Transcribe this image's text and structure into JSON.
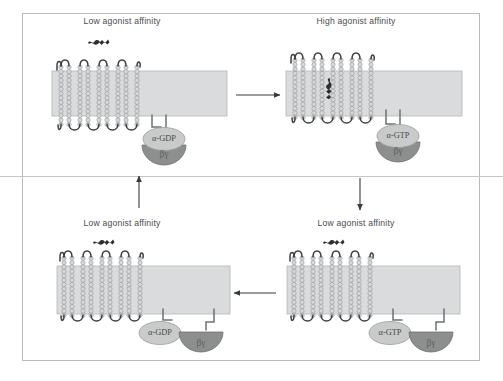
{
  "figure": {
    "type": "cycle-diagram",
    "colors": {
      "frame_border": "#b9bcbe",
      "membrane_fill": "#d9dbdc",
      "membrane_border": "#b5b8ba",
      "helix_bead": "#d5d7d8",
      "helix_outline": "#8f9294",
      "loop_stroke": "#3f3f3f",
      "alpha_fill": "#c9cbca",
      "alpha_border": "#9a9d9d",
      "betagamma_fill": "#8d8f8f",
      "betagamma_border": "#6e7070",
      "arrow": "#3a3a3a",
      "text": "#4b4b4b",
      "label_dark": "#4a4a4a"
    },
    "layout": {
      "grid": "2x2",
      "divider": "horizontal-line",
      "cycle_direction": "clockwise: top-left -> top-right -> bottom-right -> bottom-left -> top-left"
    }
  },
  "panels": [
    {
      "id": "top-left",
      "position": "top-left",
      "label": "Low agonist affinity",
      "agonist_state": "free",
      "agonist_location": "unbound, above receptor",
      "nucleotide": "GDP",
      "alpha_label": "α-GDP",
      "betagamma_label": "βγ",
      "g_protein_state": "heterotrimer-associated",
      "receptor_helices": 7
    },
    {
      "id": "top-right",
      "position": "top-right",
      "label": "High agonist affinity",
      "agonist_state": "bound",
      "agonist_location": "bound within receptor helices",
      "nucleotide": "GTP",
      "alpha_label": "α-GTP",
      "betagamma_label": "βγ",
      "g_protein_state": "heterotrimer-associated",
      "receptor_helices": 7
    },
    {
      "id": "bottom-right",
      "position": "bottom-right",
      "label": "Low agonist affinity",
      "agonist_state": "free",
      "agonist_location": "unbound, above receptor",
      "nucleotide": "GTP",
      "alpha_label": "α-GTP",
      "betagamma_label": "βγ",
      "g_protein_state": "dissociated",
      "receptor_helices": 7
    },
    {
      "id": "bottom-left",
      "position": "bottom-left",
      "label": "Low agonist affinity",
      "agonist_state": "free",
      "agonist_location": "unbound, above receptor",
      "nucleotide": "GDP",
      "alpha_label": "α-GDP",
      "betagamma_label": "βγ",
      "g_protein_state": "dissociated",
      "receptor_helices": 7
    }
  ],
  "arrows": [
    {
      "id": "top",
      "direction": "right",
      "from": "top-left",
      "to": "top-right"
    },
    {
      "id": "right",
      "direction": "down",
      "from": "top-right",
      "to": "bottom-right"
    },
    {
      "id": "bottom",
      "direction": "left",
      "from": "bottom-right",
      "to": "bottom-left"
    },
    {
      "id": "left",
      "direction": "up",
      "from": "bottom-left",
      "to": "top-left"
    }
  ]
}
